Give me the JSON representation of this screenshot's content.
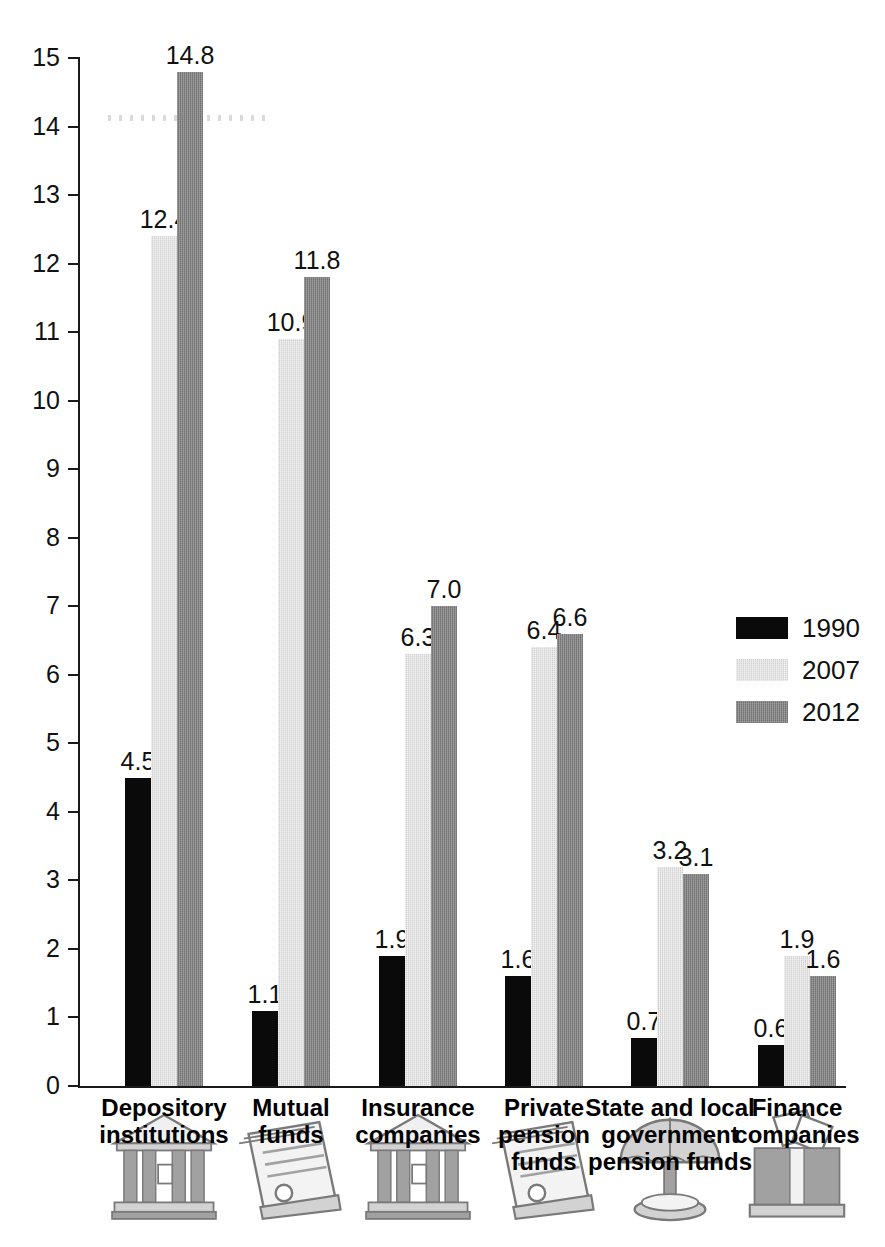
{
  "chart_data": {
    "type": "bar",
    "title": "",
    "xlabel": "",
    "ylabel": "",
    "ylim": [
      0,
      15
    ],
    "ytick_step": 1,
    "grid": false,
    "legend_position": "right",
    "categories": [
      "Depository institutions",
      "Mutual funds",
      "Insurance companies",
      "Private pension funds",
      "State and local government pension funds",
      "Finance companies"
    ],
    "category_lines": [
      [
        "Depository",
        "institutions"
      ],
      [
        "Mutual",
        "funds"
      ],
      [
        "Insurance",
        "companies"
      ],
      [
        "Private",
        "pension",
        "funds"
      ],
      [
        "State and local",
        "government",
        "pension funds"
      ],
      [
        "Finance",
        "companies"
      ]
    ],
    "category_icons": [
      "bank-building-icon",
      "document-scroll-icon",
      "bank-building-icon",
      "document-scroll-icon",
      "umbrella-icon",
      "pillar-documents-icon"
    ],
    "series": [
      {
        "name": "1990",
        "color": "#0a0a0a",
        "values": [
          4.5,
          1.1,
          1.9,
          1.6,
          0.7,
          0.6
        ]
      },
      {
        "name": "2007",
        "color": "#d0d0d0",
        "values": [
          12.4,
          10.9,
          6.3,
          6.4,
          3.2,
          1.9
        ]
      },
      {
        "name": "2012",
        "color": "#808080",
        "values": [
          14.8,
          11.8,
          7.0,
          6.6,
          3.1,
          1.6
        ]
      }
    ],
    "value_labels": [
      [
        "4.5",
        "12.4",
        "14.8"
      ],
      [
        "1.1",
        "10.9",
        "11.8"
      ],
      [
        "1.9",
        "6.3",
        "7.0"
      ],
      [
        "1.6",
        "6.4",
        "6.6"
      ],
      [
        "0.7",
        "3.2",
        "3.1"
      ],
      [
        "0.6",
        "1.9",
        "1.6"
      ]
    ],
    "ytick_labels": [
      "15",
      "14",
      "13",
      "12",
      "11",
      "10",
      "9",
      "8",
      "7",
      "6",
      "5",
      "4",
      "3",
      "2",
      "1",
      "0"
    ],
    "legend_entries": [
      {
        "label": "1990",
        "color": "#0a0a0a"
      },
      {
        "label": "2007",
        "color": "#d0d0d0"
      },
      {
        "label": "2012",
        "color": "#808080"
      }
    ]
  }
}
